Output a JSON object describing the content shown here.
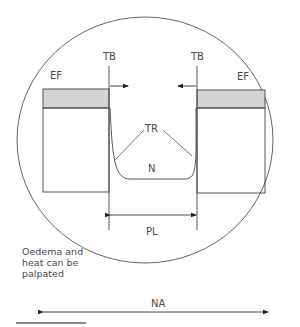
{
  "diagram": {
    "labels": {
      "tb_left": "TB",
      "tb_right": "TB",
      "ef_left": "EF",
      "ef_right": "EF",
      "tr": "TR",
      "n": "N",
      "pl": "PL",
      "na": "NA"
    },
    "note": {
      "line1": "Oedema and",
      "line2": "heat can be",
      "line3": "palpated"
    },
    "colors": {
      "stroke": "#3a3a3a",
      "band_fill": "#d4d4d4",
      "text": "#4a4a4a",
      "rule": "#111111"
    }
  }
}
